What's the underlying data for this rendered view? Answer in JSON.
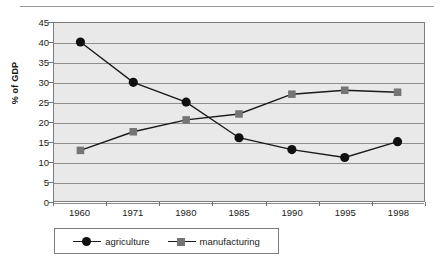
{
  "chart_data": {
    "type": "line",
    "title": "",
    "subtitle": "",
    "xlabel": "",
    "ylabel": "% of GDP",
    "categories": [
      "1960",
      "1971",
      "1980",
      "1985",
      "1990",
      "1995",
      "1998"
    ],
    "ylim": [
      0,
      45
    ],
    "ytick_values": [
      0,
      5,
      10,
      15,
      20,
      25,
      30,
      35,
      40,
      45
    ],
    "ytick_labels": [
      "0",
      "5",
      "10",
      "15",
      "20",
      "25",
      "30",
      "35",
      "40",
      "45"
    ],
    "grid": "horizontal",
    "legend_position": "bottom-left",
    "series": [
      {
        "name": "agriculture",
        "marker": "circle",
        "color": "#101010",
        "line_color": "#1a1a1a",
        "values": [
          40.2,
          30.0,
          25.0,
          16.0,
          13.0,
          11.0,
          15.0
        ]
      },
      {
        "name": "manufacturing",
        "marker": "square",
        "color": "#757575",
        "line_color": "#1a1a1a",
        "values": [
          12.8,
          17.5,
          20.5,
          22.0,
          27.0,
          28.0,
          27.5
        ]
      }
    ]
  },
  "legend": {
    "entries": [
      {
        "label": "agriculture",
        "marker": "circle-marker-icon"
      },
      {
        "label": "manufacturing",
        "marker": "square-marker-icon"
      }
    ]
  },
  "colors": {
    "plot_background": "#e9e9e9",
    "gridline": "#8e8e8e",
    "axis": "#7d7d7d",
    "agriculture": "#101010",
    "manufacturing": "#757575",
    "text": "#1a1a1a",
    "page_background": "#ffffff"
  }
}
